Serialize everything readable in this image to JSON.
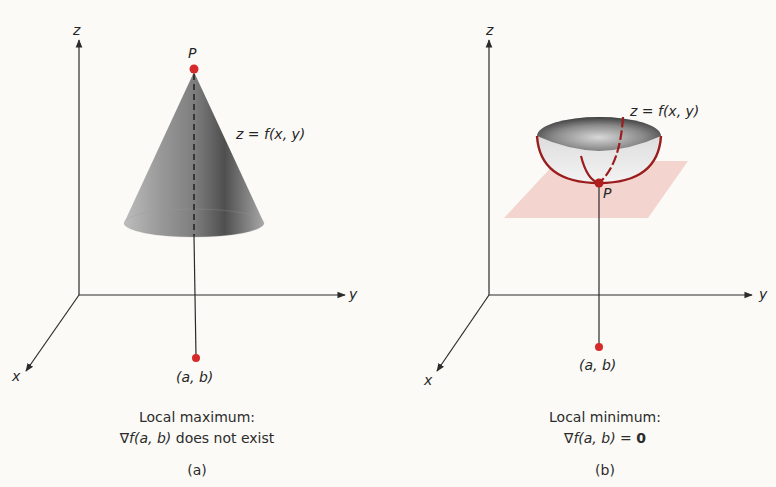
{
  "colors": {
    "background": "#fbfaf6",
    "axis": "#2b2b2b",
    "point": "#d42a2a",
    "curve": "#9a1c1c",
    "plane": "#f1cdc8"
  },
  "panel_a": {
    "axis_labels": {
      "z": "z",
      "y": "y",
      "x": "x"
    },
    "point_label": "P",
    "surface_label": "z = f(x, y)",
    "base_point_label": "(a, b)",
    "caption_line1": "Local maximum:",
    "caption_line2_prefix": "∇",
    "caption_line2_f": "f",
    "caption_line2_args": "(a, b)",
    "caption_line2_rest": " does not exist",
    "subfigure_label": "(a)"
  },
  "panel_b": {
    "axis_labels": {
      "z": "z",
      "y": "y",
      "x": "x"
    },
    "point_label": "P",
    "surface_label": "z = f(x, y)",
    "base_point_label": "(a, b)",
    "caption_line1": "Local minimum:",
    "caption_line2_prefix": "∇",
    "caption_line2_f": "f",
    "caption_line2_args": "(a, b)",
    "caption_line2_eq": " = ",
    "caption_line2_zero": "0",
    "subfigure_label": "(b)"
  }
}
